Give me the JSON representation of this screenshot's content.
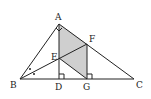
{
  "diagram": {
    "type": "geometry",
    "points": {
      "A": {
        "label": "A",
        "x": 59,
        "y": 24
      },
      "B": {
        "label": "B",
        "x": 20,
        "y": 79
      },
      "C": {
        "label": "C",
        "x": 134,
        "y": 79
      },
      "D": {
        "label": "D",
        "x": 59,
        "y": 79
      },
      "E": {
        "label": "E",
        "x": 59,
        "y": 58
      },
      "F": {
        "label": "F",
        "x": 87,
        "y": 44
      },
      "G": {
        "label": "G",
        "x": 87,
        "y": 79
      }
    },
    "shaded_region": [
      "A",
      "F",
      "G",
      "E"
    ],
    "colors": {
      "shade": "#cfcfcf",
      "line": "#222222",
      "background": "#ffffff"
    }
  }
}
